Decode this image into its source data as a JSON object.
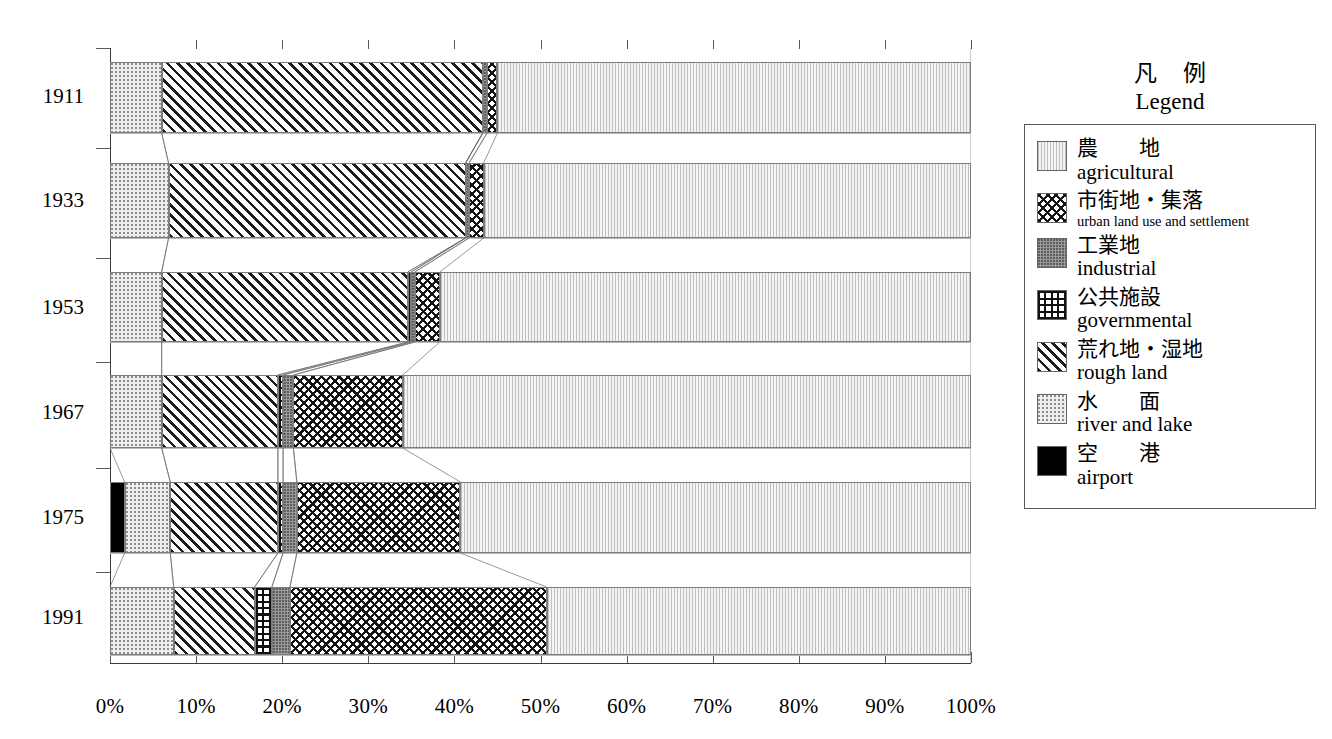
{
  "chart_data": {
    "type": "bar",
    "orientation": "horizontal",
    "stacked": true,
    "normalized": "percent",
    "title": "",
    "xlabel": "",
    "ylabel": "",
    "xlim": [
      0,
      100
    ],
    "grid": false,
    "legend_position": "right",
    "categories": [
      "1911",
      "1933",
      "1953",
      "1967",
      "1975",
      "1991"
    ],
    "xticklabels": [
      "0%",
      "10%",
      "20%",
      "30%",
      "40%",
      "50%",
      "60%",
      "70%",
      "80%",
      "90%",
      "100%"
    ],
    "xtickvalues": [
      0,
      10,
      20,
      30,
      40,
      50,
      60,
      70,
      80,
      90,
      100
    ],
    "series": [
      {
        "key": "airport",
        "name": "airport",
        "values": [
          0.0,
          0.0,
          0.0,
          0.0,
          1.7,
          0.0
        ]
      },
      {
        "key": "water",
        "name": "river and lake",
        "values": [
          6.0,
          6.8,
          6.0,
          6.0,
          5.3,
          7.4
        ]
      },
      {
        "key": "rough",
        "name": "rough land",
        "values": [
          37.3,
          34.5,
          28.6,
          13.5,
          12.5,
          9.4
        ]
      },
      {
        "key": "governmental",
        "name": "governmental",
        "values": [
          0.0,
          0.0,
          0.4,
          0.6,
          0.6,
          2.0
        ]
      },
      {
        "key": "industrial",
        "name": "industrial",
        "values": [
          0.5,
          0.4,
          0.4,
          1.2,
          1.6,
          2.1
        ]
      },
      {
        "key": "urban",
        "name": "urban land use and settlement",
        "values": [
          1.2,
          1.7,
          2.9,
          12.7,
          19.0,
          29.8
        ]
      },
      {
        "key": "agricultural",
        "name": "agricultural",
        "values": [
          55.0,
          56.6,
          61.7,
          66.0,
          59.3,
          49.3
        ]
      }
    ]
  },
  "legend": {
    "title_jp": "凡 例",
    "title_en": "Legend",
    "items": [
      {
        "jp": "農　地",
        "en": "agricultural",
        "fill": "agricultural",
        "spaced": true,
        "small_en": false
      },
      {
        "jp": "市街地・集落",
        "en": "urban land use and settlement",
        "fill": "urban",
        "spaced": false,
        "small_en": true
      },
      {
        "jp": "工業地",
        "en": "industrial",
        "fill": "industrial",
        "spaced": false,
        "small_en": false
      },
      {
        "jp": "公共施設",
        "en": "governmental",
        "fill": "governmental",
        "spaced": false,
        "small_en": false
      },
      {
        "jp": "荒れ地・湿地",
        "en": "rough land",
        "fill": "rough",
        "spaced": false,
        "small_en": false
      },
      {
        "jp": "水　面",
        "en": "river and lake",
        "fill": "water",
        "spaced": true,
        "small_en": false
      },
      {
        "jp": "空　港",
        "en": "airport",
        "fill": "airport",
        "spaced": true,
        "small_en": false
      }
    ]
  },
  "colors": {
    "axis": "#3a3a3a",
    "separator": "#b9b9b9",
    "segment_border": "#7c7c7c",
    "airport": "#000000",
    "industrial": "#9b9b9b",
    "agricultural": "#f4f4f4",
    "water": "#eeeeee"
  },
  "geometry": {
    "plot_left": 110,
    "plot_right": 971,
    "plot_top": 48,
    "plot_bottom": 663,
    "bar_rows": [
      {
        "top": 62,
        "height": 71
      },
      {
        "top": 163,
        "height": 75
      },
      {
        "top": 272,
        "height": 70
      },
      {
        "top": 375,
        "height": 73
      },
      {
        "top": 482,
        "height": 71
      },
      {
        "top": 587,
        "height": 68
      }
    ],
    "y_label_tops": [
      84,
      188,
      295,
      400,
      505,
      605
    ],
    "y_tick_ys": [
      48,
      148,
      258,
      362,
      468,
      572
    ]
  }
}
